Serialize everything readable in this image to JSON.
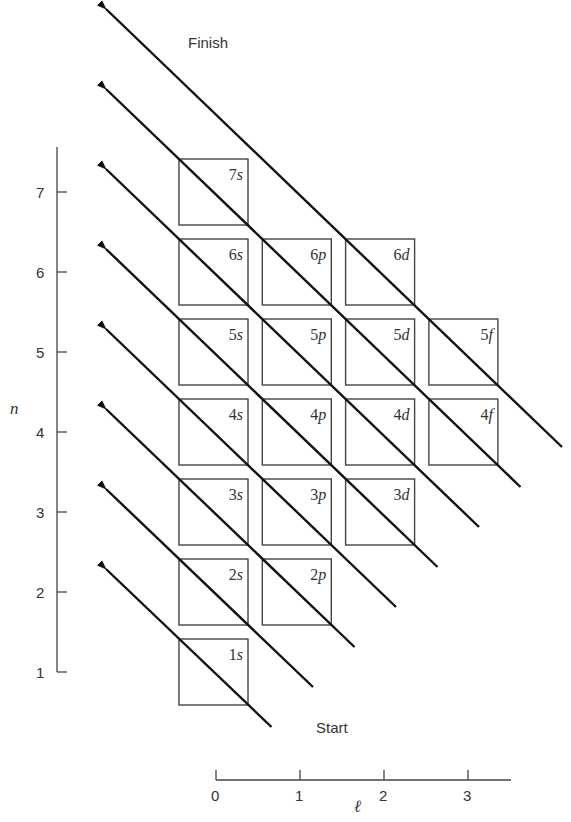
{
  "labels": {
    "finish": "Finish",
    "start": "Start",
    "y_axis_label": "n",
    "x_axis_label": "ℓ"
  },
  "y_axis": {
    "ticks": [
      "1",
      "2",
      "3",
      "4",
      "5",
      "6",
      "7"
    ]
  },
  "x_axis": {
    "ticks": [
      "0",
      "1",
      "2",
      "3"
    ]
  },
  "orbitals": [
    {
      "n": 7,
      "l": 0,
      "num": "7",
      "letter": "s"
    },
    {
      "n": 6,
      "l": 0,
      "num": "6",
      "letter": "s"
    },
    {
      "n": 6,
      "l": 1,
      "num": "6",
      "letter": "p"
    },
    {
      "n": 6,
      "l": 2,
      "num": "6",
      "letter": "d"
    },
    {
      "n": 5,
      "l": 0,
      "num": "5",
      "letter": "s"
    },
    {
      "n": 5,
      "l": 1,
      "num": "5",
      "letter": "p"
    },
    {
      "n": 5,
      "l": 2,
      "num": "5",
      "letter": "d"
    },
    {
      "n": 5,
      "l": 3,
      "num": "5",
      "letter": "f"
    },
    {
      "n": 4,
      "l": 0,
      "num": "4",
      "letter": "s"
    },
    {
      "n": 4,
      "l": 1,
      "num": "4",
      "letter": "p"
    },
    {
      "n": 4,
      "l": 2,
      "num": "4",
      "letter": "d"
    },
    {
      "n": 4,
      "l": 3,
      "num": "4",
      "letter": "f"
    },
    {
      "n": 3,
      "l": 0,
      "num": "3",
      "letter": "s"
    },
    {
      "n": 3,
      "l": 1,
      "num": "3",
      "letter": "p"
    },
    {
      "n": 3,
      "l": 2,
      "num": "3",
      "letter": "d"
    },
    {
      "n": 2,
      "l": 0,
      "num": "2",
      "letter": "s"
    },
    {
      "n": 2,
      "l": 1,
      "num": "2",
      "letter": "p"
    },
    {
      "n": 1,
      "l": 0,
      "num": "1",
      "letter": "s"
    }
  ],
  "diagonal_arrows": 8,
  "colors": {
    "line": "#111111",
    "box": "#444444",
    "text": "#333333"
  }
}
